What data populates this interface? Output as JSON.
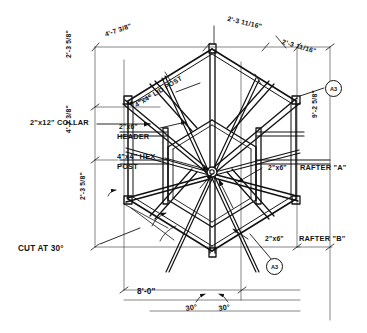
{
  "drawing": {
    "title": "Hexagonal Gazebo Roof Framing Plan",
    "medium": "hand-drawn pencil sketch on white paper",
    "ink_color": "#111111",
    "paper_color": "#ffffff",
    "view": "plan"
  },
  "dimensions": {
    "top_left": "4'-7 3/8\"",
    "top_right_inner": "2'-3 11/16\"",
    "top_right_outer": "2'-3 11/16\"",
    "left_upper": "2'-3 5/8\"",
    "left_lower_vertical": "4'-7 3/8\"",
    "left_bottom": "2'-3 5/8\"",
    "right_vertical": "9'-2 5/8\"",
    "bottom_width": "8'-0\"",
    "angle_left": "30°",
    "angle_right": "30°"
  },
  "labels": {
    "collar": "2\"x12\" COLLAR",
    "header": "2\"x6\"\nHEADER",
    "header_line1": "2\"x6\"",
    "header_line2": "HEADER",
    "hex_post_line1": "4\"x4\" HEX",
    "hex_post_line2": "POST",
    "lid_post": "4\"x4\" LID POST",
    "rafter_a": "2\"x6\"  RAFTER \"A\"",
    "rafter_a_size": "2\"x6\"",
    "rafter_a_name": "RAFTER \"A\"",
    "rafter_b_size": "2\"x6\"",
    "rafter_b_name": "RAFTER \"B\"",
    "cut_note": "CUT AT 30°"
  },
  "callouts": [
    {
      "id": "bubble-top-right",
      "text": "A3"
    },
    {
      "id": "bubble-bottom-center",
      "text": "A3"
    }
  ]
}
